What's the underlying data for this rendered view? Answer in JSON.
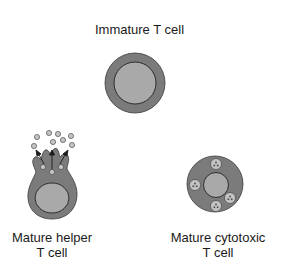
{
  "diagram": {
    "type": "cell-differentiation",
    "colors": {
      "background": "#ffffff",
      "cytoplasm": "#7b7b7b",
      "nucleus": "#a9a9a9",
      "outline": "#3a3a3a",
      "vesicle": "#c4c4c4",
      "text": "#1a1a1a"
    },
    "nodes": [
      {
        "id": "immature",
        "label": "Immature T cell",
        "shape": "round cell with large central nucleus"
      },
      {
        "id": "helper",
        "label_line1": "Mature helper",
        "label_line2": "T cell",
        "shape": "cell with apical protrusions secreting vesicles (cytokines)",
        "secreted_vesicle_count": 8,
        "internal_vesicle_count": 3,
        "arrow_count": 3
      },
      {
        "id": "cytotoxic",
        "label_line1": "Mature cytotoxic",
        "label_line2": "T cell",
        "shape": "round cell with central nucleus and cytoplasmic granules",
        "granule_count": 4
      }
    ]
  }
}
